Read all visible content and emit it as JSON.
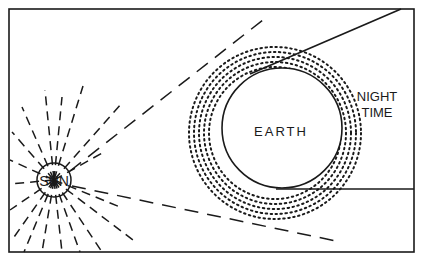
{
  "diagram": {
    "labels": {
      "sun": "SUN",
      "earth": "EARTH",
      "night_line1": "NIGHT",
      "night_line2": "TIME"
    },
    "colors": {
      "ink": "#1a1a1a",
      "background": "#ffffff"
    }
  }
}
